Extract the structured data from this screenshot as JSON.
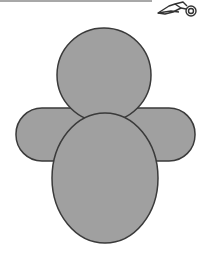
{
  "colors": {
    "fill": "#a0a0a0",
    "stroke": "#3a3a3a",
    "cut_line": "#a8a8a8"
  },
  "cut_line": {
    "icon": "scissors-icon"
  },
  "figure": {
    "shapes": [
      {
        "name": "head",
        "type": "circle",
        "cx": 104,
        "cy": 75,
        "r": 47
      },
      {
        "name": "arms",
        "type": "rounded-rect",
        "x": 16,
        "y": 108,
        "width": 179,
        "height": 53,
        "radius": 26
      },
      {
        "name": "body",
        "type": "ellipse",
        "cx": 105,
        "cy": 178,
        "rx": 53,
        "ry": 65
      }
    ]
  }
}
